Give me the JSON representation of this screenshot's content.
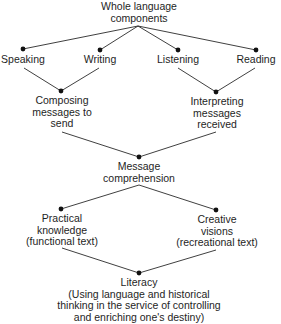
{
  "diagram": {
    "type": "hierarchy-flow",
    "root": {
      "lines": [
        "Whole language",
        "components"
      ]
    },
    "components": [
      {
        "label": "Speaking"
      },
      {
        "label": "Writing"
      },
      {
        "label": "Listening"
      },
      {
        "label": "Reading"
      }
    ],
    "intermediate": [
      {
        "lines": [
          "Composing",
          "messages to",
          "send"
        ]
      },
      {
        "lines": [
          "Interpreting",
          "messages",
          "received"
        ]
      }
    ],
    "comprehension": {
      "lines": [
        "Message",
        "comprehension"
      ]
    },
    "outcomes": [
      {
        "lines": [
          "Practical",
          "knowledge",
          "(functional text)"
        ]
      },
      {
        "lines": [
          "Creative",
          "visions",
          "(recreational text)"
        ]
      }
    ],
    "final": {
      "lines": [
        "Literacy",
        "(Using language and historical",
        "thinking in the service of controlling",
        "and enriching one's destiny)"
      ]
    },
    "edges": [
      [
        "Whole language components",
        "Speaking"
      ],
      [
        "Whole language components",
        "Writing"
      ],
      [
        "Whole language components",
        "Listening"
      ],
      [
        "Whole language components",
        "Reading"
      ],
      [
        "Speaking",
        "Composing messages to send"
      ],
      [
        "Writing",
        "Composing messages to send"
      ],
      [
        "Listening",
        "Interpreting messages received"
      ],
      [
        "Reading",
        "Interpreting messages received"
      ],
      [
        "Composing messages to send",
        "Message comprehension"
      ],
      [
        "Interpreting messages received",
        "Message comprehension"
      ],
      [
        "Message comprehension",
        "Practical knowledge (functional text)"
      ],
      [
        "Message comprehension",
        "Creative visions (recreational text)"
      ],
      [
        "Practical knowledge (functional text)",
        "Literacy"
      ],
      [
        "Creative visions (recreational text)",
        "Literacy"
      ]
    ],
    "colors": {
      "line": "#2a2a2a",
      "node": "#111111",
      "text": "#1e1e1e",
      "background": "#ffffff"
    }
  }
}
